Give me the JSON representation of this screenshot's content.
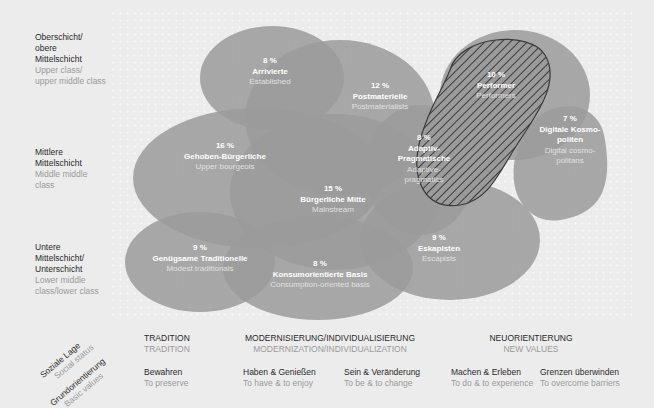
{
  "colors": {
    "background": "#ececec",
    "blob": "#9b9b9b",
    "blob_overlap": "#878787",
    "hatch": "#3a3a3a",
    "text_dark": "#2a2a2a",
    "text_light": "#9a9a9a"
  },
  "row_labels": [
    {
      "de": [
        "Oberschicht/",
        "obere",
        "Mittelschicht"
      ],
      "en": [
        "Upper class/",
        "upper middle class"
      ]
    },
    {
      "de": [
        "Mittlere",
        "Mittelschicht"
      ],
      "en": [
        "Middle middle",
        "class"
      ]
    },
    {
      "de": [
        "Untere",
        "Mittelschicht/",
        "Unterschicht"
      ],
      "en": [
        "Lower middle",
        "class/lower class"
      ]
    }
  ],
  "segments": [
    {
      "pct": "8 %",
      "name": "Arrivierte",
      "en": "Established"
    },
    {
      "pct": "12 %",
      "name": "Postmaterielle",
      "en": "Postmaterialists"
    },
    {
      "pct": "10 %",
      "name": "Performer",
      "en": "Performers"
    },
    {
      "pct": "7 %",
      "name_lines": [
        "Digitale Kosmo-",
        "politen"
      ],
      "en_lines": [
        "Digital cosmo-",
        "politans"
      ]
    },
    {
      "pct": "8 %",
      "name_lines": [
        "Adaptiv-",
        "Pragmatische"
      ],
      "en_lines": [
        "Adaptive-",
        "pragmatics"
      ]
    },
    {
      "pct": "16 %",
      "name": "Gehoben-Bürgerliche",
      "en": "Upper bourgeois"
    },
    {
      "pct": "15 %",
      "name": "Bürgerliche Mitte",
      "en": "Mainstream"
    },
    {
      "pct": "9 %",
      "name": "Genügsame Traditionelle",
      "en": "Modest traditionals"
    },
    {
      "pct": "8 %",
      "name": "Konsumorientierte Basis",
      "en": "Consumption-oriented basis"
    },
    {
      "pct": "9 %",
      "name": "Eskapisten",
      "en": "Escapists"
    }
  ],
  "axis_titles": {
    "social": {
      "de": "Soziale Lage",
      "en": "Social status"
    },
    "values": {
      "de": "Grundorientierung",
      "en": "Basic values"
    }
  },
  "axis_groups": [
    {
      "de": "TRADITION",
      "en": "TRADITION"
    },
    {
      "de": "MODERNISIERUNG/INDIVIDUALISIERUNG",
      "en": "MODERNIZATION/INDIVIDUALIZATION"
    },
    {
      "de": "NEUORIENTIERUNG",
      "en": "NEW VALUES"
    }
  ],
  "axis_values": [
    {
      "de": "Bewahren",
      "en": "To preserve"
    },
    {
      "de": "Haben & Genießen",
      "en": "To have & to enjoy"
    },
    {
      "de": "Sein & Veränderung",
      "en": "To be & to change"
    },
    {
      "de": "Machen & Erleben",
      "en": "To do & to experience"
    },
    {
      "de": "Grenzen überwinden",
      "en": "To overcome barriers"
    }
  ]
}
